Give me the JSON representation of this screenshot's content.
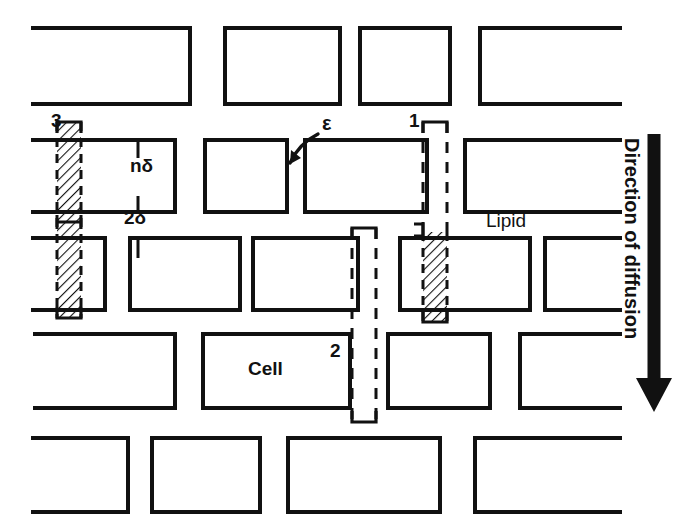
{
  "figure": {
    "type": "diagram",
    "background_color": "#ffffff",
    "ink_color": "#111111",
    "width": 690,
    "height": 532
  },
  "labels": {
    "path3": "3",
    "path1": "1",
    "path2": "2",
    "epsilon": "ε",
    "n_delta": "nδ",
    "two_delta": "2δ",
    "lipid": "Lipid",
    "cell": "Cell",
    "direction": "Direction of diffusion"
  },
  "legend_semantics": {
    "path1": "partly intercellular then transcellular route",
    "path2": "fully intercellular (dashed) route",
    "path3": "fully transcellular (hatched) route",
    "epsilon": "intercellular gap width",
    "n_delta": "cell height dimension",
    "two_delta": "intercellular slit width dimension"
  },
  "cell_rows": [
    {
      "row": 1,
      "y": 28,
      "height": 76,
      "cells": [
        {
          "x": 33,
          "w": 157,
          "open": "left"
        },
        {
          "x": 225,
          "w": 115,
          "open": "none"
        },
        {
          "x": 360,
          "w": 90,
          "open": "none"
        },
        {
          "x": 480,
          "w": 140,
          "open": "right"
        }
      ]
    },
    {
      "row": 2,
      "y": 140,
      "height": 72,
      "cells": [
        {
          "x": 33,
          "w": 142,
          "open": "left"
        },
        {
          "x": 205,
          "w": 82,
          "open": "none"
        },
        {
          "x": 305,
          "w": 122,
          "open": "none"
        },
        {
          "x": 465,
          "w": 155,
          "open": "right"
        }
      ]
    },
    {
      "row": 3,
      "y": 238,
      "height": 72,
      "cells": [
        {
          "x": 33,
          "w": 72,
          "open": "left"
        },
        {
          "x": 130,
          "w": 110,
          "open": "none"
        },
        {
          "x": 253,
          "w": 105,
          "open": "none"
        },
        {
          "x": 400,
          "w": 130,
          "open": "none"
        },
        {
          "x": 545,
          "w": 75,
          "open": "right"
        }
      ]
    },
    {
      "row": 4,
      "y": 334,
      "height": 74,
      "cells": [
        {
          "x": 35,
          "w": 140,
          "open": "left"
        },
        {
          "x": 203,
          "w": 147,
          "open": "none"
        },
        {
          "x": 388,
          "w": 102,
          "open": "none"
        },
        {
          "x": 520,
          "w": 100,
          "open": "right"
        }
      ]
    },
    {
      "row": 5,
      "y": 438,
      "height": 74,
      "cells": [
        {
          "x": 33,
          "w": 95,
          "open": "left"
        },
        {
          "x": 152,
          "w": 108,
          "open": "none"
        },
        {
          "x": 288,
          "w": 152,
          "open": "none"
        },
        {
          "x": 475,
          "w": 145,
          "open": "right"
        }
      ]
    }
  ],
  "paths": [
    {
      "id": "3",
      "x": 57,
      "width": 24,
      "top": 122,
      "bottom": 318,
      "segments": [
        {
          "from": 122,
          "to": 318,
          "style": "hatched"
        }
      ]
    },
    {
      "id": "1",
      "x": 423,
      "width": 24,
      "top": 122,
      "bottom": 322,
      "segments": [
        {
          "from": 122,
          "to": 232,
          "style": "dashed"
        },
        {
          "from": 232,
          "to": 322,
          "style": "hatched"
        }
      ]
    },
    {
      "id": "2",
      "x": 352,
      "width": 24,
      "top": 228,
      "bottom": 422,
      "segments": [
        {
          "from": 228,
          "to": 422,
          "style": "dashed"
        }
      ]
    }
  ],
  "arrow": {
    "x": 654,
    "top": 134,
    "bottom": 412,
    "shaft_width": 13,
    "head_width": 36,
    "head_height": 34
  }
}
